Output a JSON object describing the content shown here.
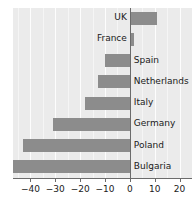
{
  "chart_data": {
    "type": "bar",
    "orientation": "horizontal",
    "title": "",
    "subtitle": "",
    "xlabel": "",
    "ylabel": "",
    "categories": [
      "UK",
      "France",
      "Spain",
      "Netherlands",
      "Italy",
      "Germany",
      "Poland",
      "Bulgaria"
    ],
    "values": [
      11,
      1.5,
      -10,
      -13,
      -18,
      -31,
      -43,
      -48
    ],
    "xlim": [
      -47,
      25
    ],
    "xticks": [
      -40,
      -30,
      -20,
      -10,
      0,
      10,
      20
    ],
    "xtick_labels": [
      "−40",
      "−30",
      "−20",
      "−10",
      "0",
      "10",
      "20"
    ],
    "grid": true,
    "grid_axis": "x",
    "legend": false,
    "series": [
      {
        "name": "change",
        "values": [
          11,
          1.5,
          -10,
          -13,
          -18,
          -31,
          -43,
          -48
        ]
      }
    ],
    "colors": {
      "bar": "#8c8c8c",
      "panel_background": "#ebebeb",
      "gridline": "#fdfdfd",
      "axis": "#6b6b6b",
      "text": "#1a1a1a",
      "figure_background": "#ffffff"
    }
  },
  "bars": [
    {
      "label": "UK",
      "value": 11
    },
    {
      "label": "France",
      "value": 1.5
    },
    {
      "label": "Spain",
      "value": -10
    },
    {
      "label": "Netherlands",
      "value": -13
    },
    {
      "label": "Italy",
      "value": -18
    },
    {
      "label": "Germany",
      "value": -31
    },
    {
      "label": "Poland",
      "value": -43
    },
    {
      "label": "Bulgaria",
      "value": -48
    }
  ],
  "axis": {
    "ticks": [
      {
        "value": -40,
        "label": "−40"
      },
      {
        "value": -30,
        "label": "−30"
      },
      {
        "value": -20,
        "label": "−20"
      },
      {
        "value": -10,
        "label": "−10"
      },
      {
        "value": 0,
        "label": "0"
      },
      {
        "value": 10,
        "label": "10"
      },
      {
        "value": 20,
        "label": "20"
      }
    ]
  }
}
